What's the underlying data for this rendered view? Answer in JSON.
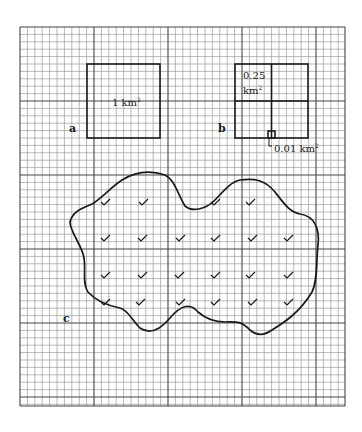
{
  "figure": {
    "grid": {
      "left": 20,
      "top": 27,
      "right": 345,
      "bottom": 406,
      "minor_spacing": 7.4,
      "major_every": 10,
      "minor_color": "#8a8a8a",
      "major_color": "#444444"
    },
    "panels": {
      "a": {
        "letter": "a",
        "square_label": "1 km",
        "square_label_sup": "2",
        "square": {
          "x": 87,
          "y": 64,
          "w": 73,
          "h": 74
        }
      },
      "b": {
        "letter": "b",
        "quarter_label_line1": "0.25",
        "quarter_label_line2": "km",
        "quarter_label_sup": "2",
        "small_label": "0.01 km",
        "small_label_sup": "2",
        "square": {
          "x": 235,
          "y": 64,
          "w": 73,
          "h": 74
        },
        "small_square": {
          "x": 268,
          "y": 131,
          "w": 7,
          "h": 7
        }
      },
      "c": {
        "letter": "c",
        "checkmark_count": 22,
        "checkmarks": [
          [
            105,
            202
          ],
          [
            143,
            202
          ],
          [
            215,
            202
          ],
          [
            250,
            202
          ],
          [
            105,
            238
          ],
          [
            142,
            238
          ],
          [
            180,
            238
          ],
          [
            215,
            238
          ],
          [
            252,
            238
          ],
          [
            288,
            238
          ],
          [
            105,
            275
          ],
          [
            142,
            275
          ],
          [
            179,
            275
          ],
          [
            215,
            275
          ],
          [
            250,
            275
          ],
          [
            288,
            275
          ],
          [
            105,
            302
          ],
          [
            140,
            302
          ],
          [
            180,
            302
          ],
          [
            215,
            302
          ],
          [
            252,
            302
          ],
          [
            288,
            302
          ]
        ]
      }
    },
    "colors": {
      "ink": "#1a1a1a",
      "background": "#ffffff"
    }
  }
}
